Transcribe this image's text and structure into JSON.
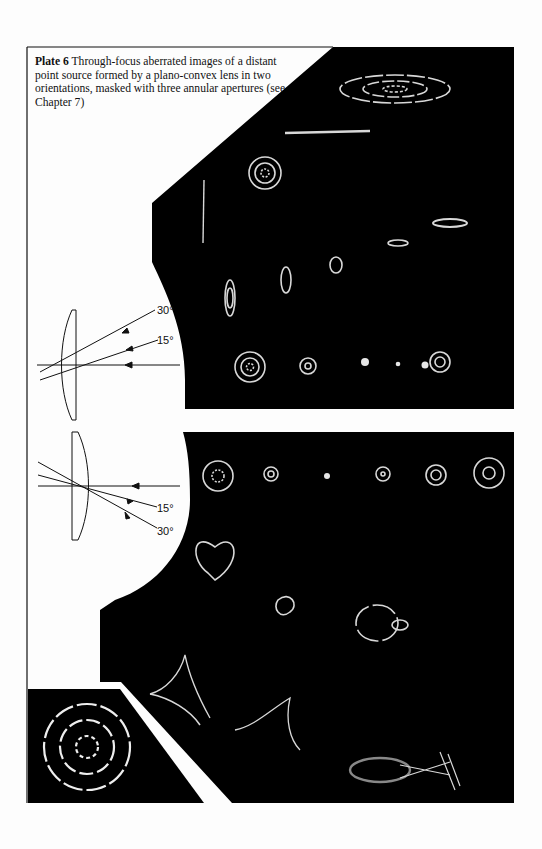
{
  "plate": {
    "label": "Plate 6",
    "caption": "Through-focus aberrated images of a distant point source formed by a plano-convex lens in two orientations, masked with three annular apertures (see Chapter 7)"
  },
  "upper_diagram": {
    "orientation": "curved side facing incoming rays",
    "angles": [
      "30°",
      "15°"
    ]
  },
  "lower_diagram": {
    "orientation": "flat side facing incoming rays",
    "angles": [
      "15°",
      "30°"
    ]
  },
  "inset": {
    "description": "mask with three annular apertures"
  },
  "colors": {
    "page": "#fdfdfd",
    "panel": "#000000",
    "ink": "#111111",
    "glow": "#d8d8d8"
  }
}
